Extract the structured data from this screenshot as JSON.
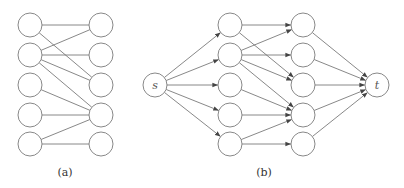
{
  "colors": {
    "node_stroke": "#7a7a7a",
    "edge": "#6a6a6a",
    "text": "#333333"
  },
  "node_radius": 12,
  "panels": [
    {
      "id": "a",
      "caption": "(a)",
      "caption_pos": [
        65,
        176
      ],
      "directed": false,
      "nodes": [
        {
          "id": "L1",
          "x": 30,
          "y": 25,
          "label": ""
        },
        {
          "id": "L2",
          "x": 30,
          "y": 55,
          "label": ""
        },
        {
          "id": "L3",
          "x": 30,
          "y": 85,
          "label": ""
        },
        {
          "id": "L4",
          "x": 30,
          "y": 115,
          "label": ""
        },
        {
          "id": "L5",
          "x": 30,
          "y": 144,
          "label": ""
        },
        {
          "id": "R1",
          "x": 101,
          "y": 25,
          "label": ""
        },
        {
          "id": "R2",
          "x": 101,
          "y": 55,
          "label": ""
        },
        {
          "id": "R3",
          "x": 101,
          "y": 85,
          "label": ""
        },
        {
          "id": "R4",
          "x": 101,
          "y": 115,
          "label": ""
        },
        {
          "id": "R5",
          "x": 101,
          "y": 144,
          "label": ""
        }
      ],
      "edges": [
        [
          "L1",
          "R1"
        ],
        [
          "L1",
          "R3"
        ],
        [
          "L2",
          "R1"
        ],
        [
          "L2",
          "R2"
        ],
        [
          "L2",
          "R3"
        ],
        [
          "L2",
          "R4"
        ],
        [
          "L3",
          "R4"
        ],
        [
          "L4",
          "R4"
        ],
        [
          "L5",
          "R4"
        ],
        [
          "L5",
          "R5"
        ]
      ]
    },
    {
      "id": "b",
      "caption": "(b)",
      "caption_pos": [
        264,
        176
      ],
      "directed": true,
      "nodes": [
        {
          "id": "s",
          "x": 155,
          "y": 85,
          "label": "s"
        },
        {
          "id": "A1",
          "x": 230,
          "y": 25,
          "label": ""
        },
        {
          "id": "A2",
          "x": 230,
          "y": 55,
          "label": ""
        },
        {
          "id": "A3",
          "x": 230,
          "y": 85,
          "label": ""
        },
        {
          "id": "A4",
          "x": 230,
          "y": 115,
          "label": ""
        },
        {
          "id": "A5",
          "x": 230,
          "y": 144,
          "label": ""
        },
        {
          "id": "B1",
          "x": 303,
          "y": 25,
          "label": ""
        },
        {
          "id": "B2",
          "x": 303,
          "y": 55,
          "label": ""
        },
        {
          "id": "B3",
          "x": 303,
          "y": 85,
          "label": ""
        },
        {
          "id": "B4",
          "x": 303,
          "y": 115,
          "label": ""
        },
        {
          "id": "B5",
          "x": 303,
          "y": 144,
          "label": ""
        },
        {
          "id": "t",
          "x": 377,
          "y": 85,
          "label": "t"
        }
      ],
      "edges": [
        [
          "s",
          "A1"
        ],
        [
          "s",
          "A2"
        ],
        [
          "s",
          "A3"
        ],
        [
          "s",
          "A4"
        ],
        [
          "s",
          "A5"
        ],
        [
          "A1",
          "B1"
        ],
        [
          "A1",
          "B3"
        ],
        [
          "A2",
          "B1"
        ],
        [
          "A2",
          "B2"
        ],
        [
          "A2",
          "B3"
        ],
        [
          "A2",
          "B4"
        ],
        [
          "A3",
          "B4"
        ],
        [
          "A4",
          "B4"
        ],
        [
          "A5",
          "B4"
        ],
        [
          "A5",
          "B5"
        ],
        [
          "B1",
          "t"
        ],
        [
          "B2",
          "t"
        ],
        [
          "B3",
          "t"
        ],
        [
          "B4",
          "t"
        ],
        [
          "B5",
          "t"
        ]
      ]
    }
  ]
}
